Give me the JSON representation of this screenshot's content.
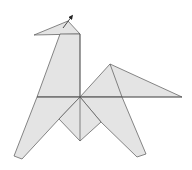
{
  "figure": {
    "colors": {
      "background": "#ffffff",
      "paper_fill": "#e4e4e4",
      "line": "#555555",
      "arrow": "#222222"
    },
    "points": {
      "head_left": [
        34,
        35
      ],
      "head_apex": [
        68,
        21
      ],
      "head_right": [
        80,
        34
      ],
      "neck_top_left": [
        60,
        34
      ],
      "body_left": [
        37,
        97
      ],
      "center": [
        80,
        97
      ],
      "tail_apex": [
        110,
        64
      ],
      "tail_tip": [
        182,
        97
      ],
      "left_inner": [
        59,
        119
      ],
      "bottom_center": [
        80,
        141
      ],
      "right_inner": [
        101,
        122
      ],
      "left_foot_a": [
        14,
        156
      ],
      "left_foot_b": [
        22,
        159
      ],
      "right_foot_a": [
        137,
        157
      ],
      "right_foot_b": [
        146,
        154
      ],
      "arrow_start": [
        63,
        28
      ],
      "arrow_tip": [
        73,
        15
      ]
    }
  }
}
